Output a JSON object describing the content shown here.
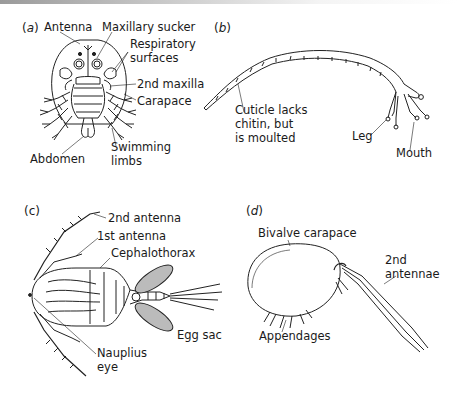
{
  "figure": {
    "panels": [
      {
        "id": "a",
        "letter_open": "(",
        "letter": "a",
        "letter_close": ")",
        "labels": {
          "antenna": "Antenna",
          "maxillary_sucker": "Maxillary sucker",
          "respiratory_surfaces": "Respiratory\nsurfaces",
          "second_maxilla": "2nd maxilla",
          "carapace": "Carapace",
          "abdomen": "Abdomen",
          "swimming_limbs": "Swimming\nlimbs"
        }
      },
      {
        "id": "b",
        "letter_open": "(",
        "letter": "b",
        "letter_close": ")",
        "labels": {
          "cuticle": "Cuticle lacks\nchitin, but\nis moulted",
          "leg": "Leg",
          "mouth": "Mouth"
        }
      },
      {
        "id": "c",
        "letter_open": "(",
        "letter": "c",
        "letter_close": ")",
        "labels": {
          "second_antenna": "2nd antenna",
          "first_antenna": "1st antenna",
          "cephalothorax": "Cephalothorax",
          "egg_sac": "Egg sac",
          "nauplius_eye": "Nauplius\neye"
        }
      },
      {
        "id": "d",
        "letter_open": "(",
        "letter": "d",
        "letter_close": ")",
        "labels": {
          "bivalve_carapace": "Bivalve carapace",
          "second_antennae": "2nd\nantennae",
          "appendages": "Appendages"
        }
      }
    ]
  }
}
